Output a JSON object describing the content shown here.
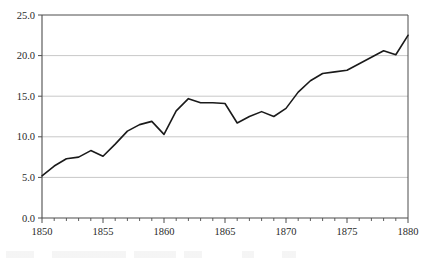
{
  "figure": {
    "background_color": "#ffffff",
    "plot_border_color": "#4d4d4d",
    "gridline_color": "#c8c8c8",
    "line_color": "#1a1a1a",
    "tick_label_color": "#2a2a2a"
  },
  "chart_data": {
    "type": "line",
    "title": "",
    "subtitle": "",
    "xlabel": "",
    "ylabel": "",
    "xlim": [
      1850,
      1880
    ],
    "ylim": [
      0.0,
      25.0
    ],
    "grid": true,
    "grid_axis": "y",
    "legend": false,
    "legend_position": "none",
    "y_ticks": [
      0.0,
      5.0,
      10.0,
      15.0,
      20.0,
      25.0
    ],
    "y_tick_labels": [
      "0.0",
      "5.0",
      "10.0",
      "15.0",
      "20.0",
      "25.0"
    ],
    "x_major_ticks": [
      1850,
      1855,
      1860,
      1865,
      1870,
      1875,
      1880
    ],
    "x_tick_labels": [
      "1850",
      "1855",
      "1860",
      "1865",
      "1870",
      "1875",
      "1880"
    ],
    "x_minor_tick_step": 1,
    "x": [
      1850,
      1851,
      1852,
      1853,
      1854,
      1855,
      1856,
      1857,
      1858,
      1859,
      1860,
      1861,
      1862,
      1863,
      1864,
      1865,
      1866,
      1867,
      1868,
      1869,
      1870,
      1871,
      1872,
      1873,
      1874,
      1875,
      1876,
      1877,
      1878,
      1879,
      1880
    ],
    "values": [
      5.2,
      6.4,
      7.3,
      7.5,
      8.3,
      7.6,
      9.1,
      10.7,
      11.5,
      11.9,
      10.3,
      13.2,
      14.7,
      14.2,
      14.2,
      14.1,
      11.7,
      12.5,
      13.1,
      12.5,
      13.5,
      15.5,
      16.9,
      17.8,
      18.0,
      18.2,
      19.0,
      19.8,
      20.6,
      20.1,
      22.5
    ],
    "series": [
      {
        "name": "series-1",
        "color": "#1a1a1a",
        "line_width": 1.6,
        "markers": false,
        "values": [
          5.2,
          6.4,
          7.3,
          7.5,
          8.3,
          7.6,
          9.1,
          10.7,
          11.5,
          11.9,
          10.3,
          13.2,
          14.7,
          14.2,
          14.2,
          14.1,
          11.7,
          12.5,
          13.1,
          12.5,
          13.5,
          15.5,
          16.9,
          17.8,
          18.0,
          18.2,
          19.0,
          19.8,
          20.6,
          20.1,
          22.5
        ]
      }
    ]
  }
}
